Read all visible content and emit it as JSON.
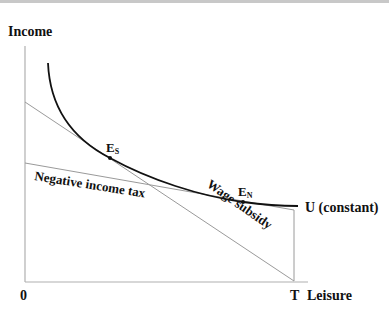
{
  "diagram": {
    "y_axis_label": "Income",
    "x_axis_label": "Leisure",
    "origin_label": "0",
    "t_label": "T",
    "curve_label": "U (constant)",
    "point_s": {
      "main": "E",
      "sub": "S"
    },
    "point_n": {
      "main": "E",
      "sub": "N"
    },
    "line_negative_income_tax": "Negative income tax",
    "line_wage_subsidy": "Wage subsidy",
    "colors": {
      "axis": "#b0b0b0",
      "budget_lines": "#a0a0a0",
      "curve": "#111111",
      "text": "#111111"
    }
  }
}
